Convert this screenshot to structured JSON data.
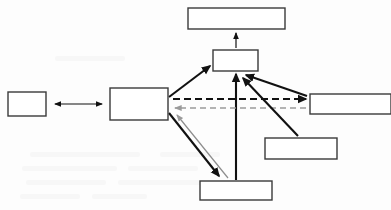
{
  "figure": {
    "type": "block-diagram",
    "width": 391,
    "height": 210,
    "background_color": "#fdfdfd",
    "caption": ""
  },
  "palette": {
    "box_stroke": "#3a3a3a",
    "box_fill": "#ffffff",
    "arrow_black": "#111111",
    "arrow_gray": "#9a9a9a"
  },
  "nodes": [
    {
      "id": "far-left",
      "label": "",
      "x": 8,
      "y": 92,
      "w": 38,
      "h": 24
    },
    {
      "id": "center-left",
      "label": "",
      "x": 110,
      "y": 88,
      "w": 58,
      "h": 32
    },
    {
      "id": "top",
      "label": "",
      "x": 188,
      "y": 8,
      "w": 97,
      "h": 21
    },
    {
      "id": "center",
      "label": "",
      "x": 213,
      "y": 50,
      "w": 45,
      "h": 21
    },
    {
      "id": "right",
      "label": "",
      "x": 310,
      "y": 94,
      "w": 81,
      "h": 20
    },
    {
      "id": "lower-right",
      "label": "",
      "x": 265,
      "y": 138,
      "w": 72,
      "h": 21
    },
    {
      "id": "bottom",
      "label": "",
      "x": 200,
      "y": 181,
      "w": 72,
      "h": 19
    }
  ],
  "edges": [
    {
      "id": "far-left-center-left",
      "from": "far-left",
      "to": "center-left",
      "style": "solid",
      "color": "#111111",
      "weight": "thin",
      "heads": "both"
    },
    {
      "id": "top-from-center",
      "from": "center",
      "to": "top",
      "style": "solid",
      "color": "#111111",
      "weight": "thin",
      "heads": "end"
    },
    {
      "id": "center-left-to-center",
      "from": "center-left",
      "to": "center",
      "style": "solid",
      "color": "#111111",
      "weight": "thick",
      "heads": "end"
    },
    {
      "id": "bottom-to-center",
      "from": "bottom",
      "to": "center",
      "style": "solid",
      "color": "#111111",
      "weight": "thick",
      "heads": "end"
    },
    {
      "id": "center-left-to-bottom",
      "from": "center-left",
      "to": "bottom",
      "style": "solid",
      "color": "#111111",
      "weight": "thick",
      "heads": "end"
    },
    {
      "id": "bottom-to-center-left",
      "from": "bottom",
      "to": "center-left",
      "style": "solid",
      "color": "#9a9a9a",
      "weight": "thin",
      "heads": "end"
    },
    {
      "id": "center-left-to-right",
      "from": "center-left",
      "to": "right",
      "style": "dashed",
      "color": "#111111",
      "weight": "thick",
      "heads": "end"
    },
    {
      "id": "right-to-center-left",
      "from": "right",
      "to": "center-left",
      "style": "dashed",
      "color": "#9a9a9a",
      "weight": "thin",
      "heads": "end"
    },
    {
      "id": "right-to-center",
      "from": "right",
      "to": "center",
      "style": "solid",
      "color": "#111111",
      "weight": "thick",
      "heads": "end"
    },
    {
      "id": "lower-right-to-center",
      "from": "lower-right",
      "to": "center",
      "style": "solid",
      "color": "#111111",
      "weight": "thick",
      "heads": "end"
    }
  ]
}
